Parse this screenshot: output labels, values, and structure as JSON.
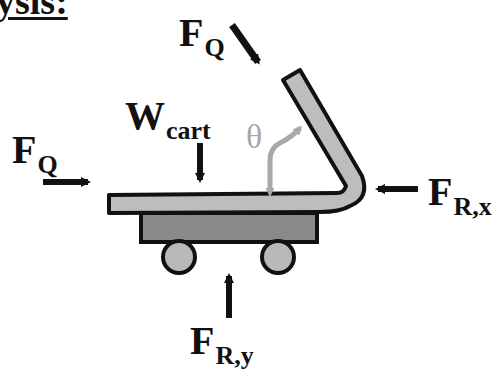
{
  "header_fragment": "ysis:",
  "diagram": {
    "labels": {
      "fq_top": {
        "main": "F",
        "sub": "Q"
      },
      "fq_left": {
        "main": "F",
        "sub": "Q"
      },
      "w_cart": {
        "main": "W",
        "sub": "cart"
      },
      "fr_x": {
        "main": "F",
        "sub": "R,x"
      },
      "fr_y": {
        "main": "F",
        "sub": "R,y"
      },
      "theta": "θ"
    },
    "colors": {
      "outline": "#111111",
      "handle_fill": "#bdbdbd",
      "base_fill": "#8a8a8a",
      "wheel_fill": "#b8b8b8",
      "theta_arrow": "#a8a8a8"
    }
  }
}
